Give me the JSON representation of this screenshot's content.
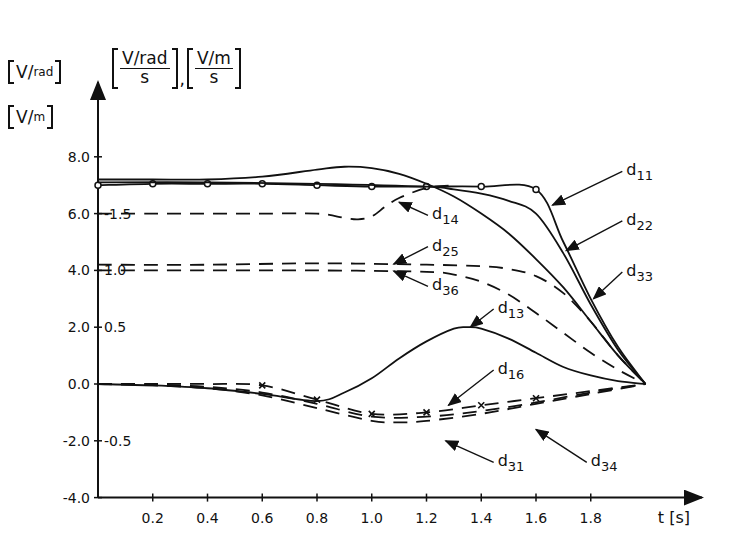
{
  "chart_data": {
    "type": "line",
    "title": "",
    "xlabel": "t [s]",
    "ylabel_left_primary": "[V/rad]",
    "ylabel_left_secondary": "[V/m]",
    "ylabel_right": "[(V/rad)/s], [(V/m)/s]",
    "xlim": [
      0,
      2.0
    ],
    "ylim": [
      -4.0,
      8.0
    ],
    "grid": false,
    "x_ticks": [
      0.2,
      0.4,
      0.6,
      0.8,
      1.0,
      1.2,
      1.4,
      1.6,
      1.8
    ],
    "x_tick_labels": [
      "0.2",
      "0.4",
      "0.6",
      "0.8",
      "1.0",
      "1.2",
      "1.4",
      "1.6",
      "1.8"
    ],
    "y_ticks": [
      8.0,
      6.0,
      4.0,
      2.0,
      0.0,
      -2.0,
      -4.0
    ],
    "y_tick_labels": [
      "8.0",
      "6.0",
      "4.0",
      "2.0",
      "0.0",
      "-2.0",
      "-4.0"
    ],
    "y2_ticks": [
      {
        "label": "-1.5",
        "at": 6.0
      },
      {
        "label": "1.0",
        "at": 4.0
      },
      {
        "label": "0.5",
        "at": 2.0
      },
      {
        "label": "-0.5",
        "at": -2.0
      }
    ],
    "series": [
      {
        "name": "d11",
        "style": "solid",
        "marker": "circle",
        "x": [
          0,
          0.2,
          0.4,
          0.6,
          0.8,
          1.0,
          1.2,
          1.4,
          1.6,
          1.7,
          1.8,
          1.9,
          2.0
        ],
        "values": [
          7.0,
          7.05,
          7.05,
          7.05,
          7.0,
          6.95,
          6.95,
          6.95,
          6.85,
          5.0,
          3.0,
          1.3,
          0.0
        ]
      },
      {
        "name": "d22",
        "style": "solid",
        "marker": "none",
        "x": [
          0,
          0.2,
          0.4,
          0.6,
          0.8,
          0.9,
          1.0,
          1.1,
          1.2,
          1.3,
          1.4,
          1.5,
          1.6,
          1.7,
          1.8,
          1.9,
          2.0
        ],
        "values": [
          7.2,
          7.2,
          7.2,
          7.3,
          7.55,
          7.65,
          7.6,
          7.4,
          7.05,
          6.6,
          6.0,
          5.3,
          4.4,
          3.4,
          2.2,
          1.0,
          0.0
        ]
      },
      {
        "name": "d33",
        "style": "solid",
        "marker": "none",
        "x": [
          0,
          0.4,
          0.8,
          1.2,
          1.3,
          1.4,
          1.5,
          1.6,
          1.7,
          1.8,
          1.9,
          2.0
        ],
        "values": [
          7.1,
          7.1,
          7.05,
          6.95,
          6.85,
          6.7,
          6.45,
          6.0,
          4.6,
          2.8,
          1.2,
          0.0
        ]
      },
      {
        "name": "d14",
        "style": "dashed",
        "marker": "none",
        "x": [
          0,
          0.2,
          0.4,
          0.6,
          0.8,
          0.9,
          0.95,
          1.0,
          1.05,
          1.1,
          1.2,
          1.3
        ],
        "values": [
          6.0,
          6.0,
          6.0,
          6.0,
          6.0,
          5.85,
          5.8,
          5.9,
          6.25,
          6.55,
          6.9,
          7.0
        ]
      },
      {
        "name": "d25",
        "style": "dashed",
        "marker": "none",
        "x": [
          0,
          0.4,
          0.8,
          1.2,
          1.4,
          1.5,
          1.6,
          1.7,
          1.8,
          1.9,
          2.0
        ],
        "values": [
          4.2,
          4.2,
          4.25,
          4.2,
          4.15,
          4.05,
          3.8,
          3.2,
          2.2,
          1.0,
          0.0
        ]
      },
      {
        "name": "d36",
        "style": "dashed",
        "marker": "none",
        "x": [
          0,
          0.4,
          0.8,
          1.2,
          1.3,
          1.4,
          1.5,
          1.6,
          1.7,
          1.8,
          1.9,
          2.0
        ],
        "values": [
          4.0,
          4.0,
          4.0,
          3.95,
          3.85,
          3.6,
          3.15,
          2.5,
          1.8,
          1.1,
          0.5,
          0.0
        ]
      },
      {
        "name": "d13",
        "style": "solid",
        "marker": "none",
        "x": [
          0,
          0.2,
          0.4,
          0.6,
          0.8,
          0.9,
          1.0,
          1.1,
          1.2,
          1.3,
          1.35,
          1.4,
          1.5,
          1.6,
          1.7,
          1.8,
          1.9,
          2.0
        ],
        "values": [
          0.0,
          -0.05,
          -0.15,
          -0.35,
          -0.6,
          -0.3,
          0.2,
          0.9,
          1.5,
          1.95,
          2.0,
          1.95,
          1.6,
          1.1,
          0.6,
          0.3,
          0.1,
          0.0
        ]
      },
      {
        "name": "d16",
        "style": "dashed",
        "marker": "x",
        "x": [
          0,
          0.2,
          0.4,
          0.6,
          0.8,
          1.0,
          1.2,
          1.4,
          1.6,
          1.8,
          2.0
        ],
        "values": [
          0.0,
          0.0,
          0.0,
          -0.05,
          -0.55,
          -1.05,
          -1.0,
          -0.75,
          -0.5,
          -0.25,
          0.0
        ]
      },
      {
        "name": "d31",
        "style": "dashed",
        "marker": "none",
        "x": [
          0,
          0.2,
          0.4,
          0.6,
          0.8,
          1.0,
          1.1,
          1.2,
          1.4,
          1.6,
          1.8,
          2.0
        ],
        "values": [
          0.0,
          -0.05,
          -0.15,
          -0.4,
          -0.85,
          -1.3,
          -1.35,
          -1.3,
          -1.05,
          -0.7,
          -0.35,
          0.0
        ]
      },
      {
        "name": "d34",
        "style": "dashed",
        "marker": "none",
        "x": [
          0,
          0.2,
          0.4,
          0.6,
          0.8,
          1.0,
          1.2,
          1.4,
          1.6,
          1.8,
          2.0
        ],
        "values": [
          0.0,
          -0.02,
          -0.1,
          -0.3,
          -0.7,
          -1.15,
          -1.15,
          -0.95,
          -0.65,
          -0.3,
          0.0
        ]
      }
    ],
    "annotations": [
      {
        "text": "d11",
        "label_xy": [
          1.93,
          7.35
        ],
        "arrow_to": [
          1.66,
          6.3
        ]
      },
      {
        "text": "d22",
        "label_xy": [
          1.93,
          5.6
        ],
        "arrow_to": [
          1.71,
          4.7
        ]
      },
      {
        "text": "d33",
        "label_xy": [
          1.93,
          3.8
        ],
        "arrow_to": [
          1.81,
          3.0
        ]
      },
      {
        "text": "d14",
        "label_xy": [
          1.22,
          5.8
        ],
        "arrow_to": [
          1.1,
          6.4
        ]
      },
      {
        "text": "d25",
        "label_xy": [
          1.22,
          4.7
        ],
        "arrow_to": [
          1.08,
          4.22
        ]
      },
      {
        "text": "d36",
        "label_xy": [
          1.22,
          3.3
        ],
        "arrow_to": [
          1.08,
          3.98
        ]
      },
      {
        "text": "d13",
        "label_xy": [
          1.46,
          2.5
        ],
        "arrow_to": [
          1.36,
          2.0
        ]
      },
      {
        "text": "d16",
        "label_xy": [
          1.46,
          0.35
        ],
        "arrow_to": [
          1.28,
          -0.75
        ]
      },
      {
        "text": "d31",
        "label_xy": [
          1.46,
          -2.9
        ],
        "arrow_to": [
          1.27,
          -2.0
        ]
      },
      {
        "text": "d34",
        "label_xy": [
          1.8,
          -2.9
        ],
        "arrow_to": [
          1.6,
          -1.6
        ]
      }
    ]
  },
  "axes": {
    "left_unit_top": {
      "num": "V",
      "den": "rad"
    },
    "left_unit_bottom": {
      "num": "V",
      "den": "m"
    },
    "right_unit_a": {
      "num": "V/rad",
      "den": "s"
    },
    "right_unit_b": {
      "num": "V/m",
      "den": "s"
    },
    "unit_separator": ",",
    "xlabel": "t [s]"
  }
}
